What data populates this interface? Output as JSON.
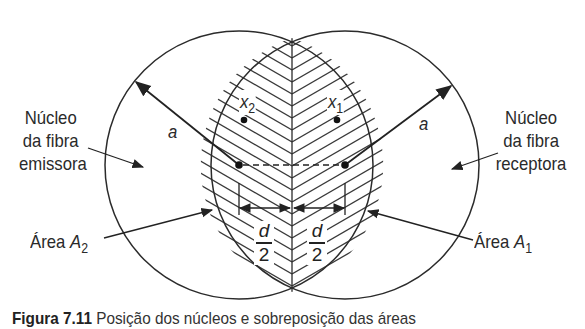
{
  "labels": {
    "emitter_core": [
      "Núcleo",
      "da fibra",
      "emissora"
    ],
    "receiver_core": [
      "Núcleo",
      "da fibra",
      "receptora"
    ],
    "area_left": {
      "text": "Área ",
      "symbol": "A",
      "sub": "2"
    },
    "area_right": {
      "text": "Área ",
      "symbol": "A",
      "sub": "1"
    },
    "radius_left": "a",
    "radius_right": "a",
    "point_left": {
      "symbol": "x",
      "sub": "2"
    },
    "point_right": {
      "symbol": "x",
      "sub": "1"
    },
    "half_distance_left": {
      "num": "d",
      "den": "2"
    },
    "half_distance_right": {
      "num": "d",
      "den": "2"
    }
  },
  "caption": {
    "figure_number": "Figura 7.11",
    "text": "Posição dos núcleos e sobreposição das áreas"
  },
  "geometry": {
    "left_center": [
      239,
      165
    ],
    "right_center": [
      345,
      165
    ],
    "radius": 134,
    "stroke_color": "#2b2b2b",
    "hatch_color": "#3a3a3a"
  }
}
